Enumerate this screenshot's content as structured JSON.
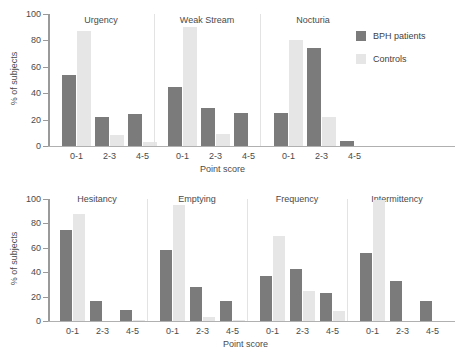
{
  "chart_data": {
    "type": "bar",
    "title": "",
    "xlabel": "Point score",
    "ylabel": "% of subjects",
    "ylim": [
      0,
      100
    ],
    "yticks": [
      0,
      20,
      40,
      60,
      80,
      100
    ],
    "categories": [
      "0-1",
      "2-3",
      "4-5"
    ],
    "grid": false,
    "legend_position": "right",
    "legend": [
      "BPH patients",
      "Controls"
    ],
    "series_names": [
      "BPH patients",
      "Controls"
    ],
    "colors": {
      "bph": "#7b7b7b",
      "controls": "#e6e6e6",
      "axis": "#9a9a9a",
      "text": "#4a4a4a"
    },
    "rows": [
      {
        "row_id": "top",
        "panels": [
          {
            "name": "Urgency",
            "bph": [
              54,
              22,
              24
            ],
            "controls": [
              87,
              8,
              3
            ]
          },
          {
            "name": "Weak Stream",
            "bph": [
              45,
              29,
              25
            ],
            "controls": [
              90,
              9,
              0
            ]
          },
          {
            "name": "Nocturia",
            "bph": [
              25,
              74,
              4
            ],
            "controls": [
              80,
              22,
              0
            ]
          }
        ]
      },
      {
        "row_id": "bottom",
        "panels": [
          {
            "name": "Hesitancy",
            "bph": [
              75,
              16,
              9
            ],
            "controls": [
              88,
              0,
              1
            ]
          },
          {
            "name": "Emptying",
            "bph": [
              58,
              28,
              16
            ],
            "controls": [
              95,
              3,
              1
            ]
          },
          {
            "name": "Frequency",
            "bph": [
              37,
              43,
              23
            ],
            "controls": [
              70,
              25,
              8
            ]
          },
          {
            "name": "Intermittency",
            "bph": [
              56,
              33,
              16
            ],
            "controls": [
              99,
              0,
              0
            ]
          }
        ]
      }
    ]
  },
  "legend": {
    "items": [
      {
        "label": "BPH patients",
        "key": "bph"
      },
      {
        "label": "Controls",
        "key": "controls"
      }
    ]
  },
  "axes": {
    "ylabel": "% of subjects",
    "xlabel": "Point score",
    "ytick_labels": [
      "100",
      "80",
      "60",
      "40",
      "20",
      "0"
    ]
  }
}
